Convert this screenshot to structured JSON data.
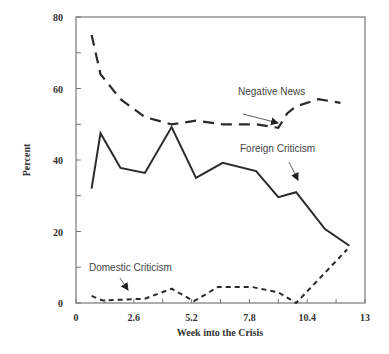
{
  "chart_data": {
    "type": "line",
    "title": "",
    "xlabel": "Week into the Crisis",
    "ylabel": "Percent",
    "xlim": [
      0,
      13
    ],
    "ylim": [
      0,
      80
    ],
    "x_ticks": [
      "0",
      "2.6",
      "5.2",
      "7.8",
      "10.4",
      "13"
    ],
    "y_ticks": [
      "0",
      "20",
      "40",
      "60",
      "80"
    ],
    "grid": false,
    "legend": "inline annotations with arrows",
    "series": [
      {
        "name": "Negative News",
        "style": "long-dash",
        "x": [
          0.7,
          1.1,
          2.0,
          3.1,
          4.3,
          5.4,
          6.6,
          8.1,
          9.1,
          9.5,
          9.9,
          10.9,
          11.9
        ],
        "values": [
          75,
          64,
          57,
          52,
          50,
          51,
          50,
          50,
          49,
          53,
          55,
          57,
          56
        ]
      },
      {
        "name": "Foreign Criticism",
        "style": "solid",
        "x": [
          0.7,
          1.1,
          2.0,
          3.1,
          4.3,
          5.4,
          6.6,
          8.1,
          9.1,
          9.9,
          11.2,
          12.3
        ],
        "values": [
          32,
          47.5,
          37.8,
          36.4,
          49.2,
          35,
          39.2,
          36.9,
          29.6,
          31,
          20.7,
          16
        ]
      },
      {
        "name": "Domestic Criticism",
        "style": "short-dash",
        "x": [
          0.7,
          1.2,
          3.1,
          4.3,
          5.3,
          6.4,
          7.9,
          9.1,
          9.9,
          12.2
        ],
        "values": [
          2,
          0.7,
          1.2,
          4,
          0.5,
          4.5,
          4.5,
          3,
          0,
          15
        ]
      }
    ],
    "annotations": [
      {
        "text": "Negative News",
        "target_series": "Negative News"
      },
      {
        "text": "Foreign Criticism",
        "target_series": "Foreign Criticism"
      },
      {
        "text": "Domestic Criticism",
        "target_series": "Domestic Criticism"
      }
    ]
  }
}
